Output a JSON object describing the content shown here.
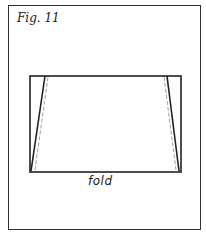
{
  "figure": {
    "label": "Fig. 11",
    "fold_label": "fold",
    "line_color": "#222222",
    "dash_color": "#888888"
  }
}
